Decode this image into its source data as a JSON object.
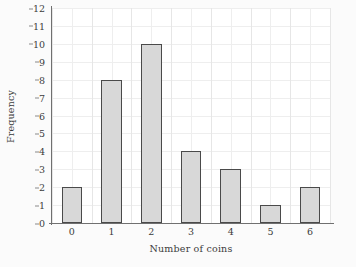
{
  "chart_data": {
    "type": "bar",
    "title": "",
    "subtitle": "",
    "xlabel": "Number of coins",
    "ylabel": "Frequency",
    "categories": [
      "0",
      "1",
      "2",
      "3",
      "4",
      "5",
      "6"
    ],
    "values": [
      2,
      8,
      10,
      4,
      3,
      1,
      2
    ],
    "series": [
      {
        "name": "Frequency",
        "values": [
          2,
          8,
          10,
          4,
          3,
          1,
          2
        ]
      }
    ],
    "xlim": [
      -0.5,
      6.5
    ],
    "ylim": [
      0,
      12
    ],
    "y_ticks": [
      "0",
      "1",
      "2",
      "3",
      "4",
      "5",
      "6",
      "7",
      "8",
      "9",
      "10",
      "11",
      "12"
    ],
    "x_ticks": [
      "0",
      "1",
      "2",
      "3",
      "4",
      "5",
      "6"
    ],
    "grid": true,
    "grid_orientation": "both",
    "legend": false,
    "legend_position": "none",
    "annotations": [],
    "colors": {
      "bar_fill": "#d8d8d8",
      "bar_edge": "#4a4a4a",
      "grid": "#eeeeee",
      "axis": "#707070",
      "text": "#3b3b3b",
      "plot_background": "#ffffff",
      "figure_background": "#fbfbfb"
    }
  }
}
